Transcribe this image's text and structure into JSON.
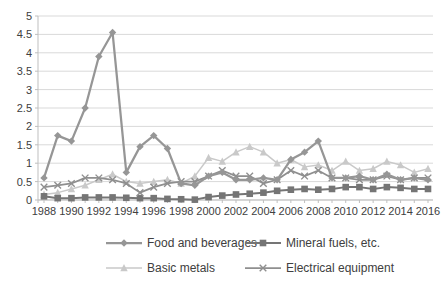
{
  "chart_data": {
    "type": "line",
    "title": "",
    "xlabel": "",
    "ylabel": "",
    "ylim": [
      0,
      5
    ],
    "grid": "horizontal",
    "legend_position": "bottom",
    "axis_text_color": "#404040",
    "gridline_color": "#D9D9D9",
    "axis_line_color": "#BFBFBF",
    "x": [
      1988,
      1989,
      1990,
      1991,
      1992,
      1993,
      1994,
      1995,
      1996,
      1997,
      1998,
      1999,
      2000,
      2001,
      2002,
      2003,
      2004,
      2005,
      2006,
      2007,
      2008,
      2009,
      2010,
      2011,
      2012,
      2013,
      2014,
      2015,
      2016
    ],
    "x_tick_labels": [
      "1988",
      "1990",
      "1992",
      "1994",
      "1996",
      "1998",
      "2000",
      "2002",
      "2004",
      "2006",
      "2008",
      "2010",
      "2012",
      "2014",
      "2016"
    ],
    "y_tick_labels": [
      "0",
      "0.5",
      "1",
      "1.5",
      "2",
      "2.5",
      "3",
      "3.5",
      "4",
      "4.5",
      "5"
    ],
    "series": [
      {
        "name": "Food and beverages",
        "marker": "diamond",
        "color": "#969696",
        "line_width": 2.25,
        "values": [
          0.6,
          1.75,
          1.6,
          2.5,
          3.9,
          4.55,
          0.75,
          1.45,
          1.75,
          1.4,
          0.45,
          0.4,
          0.65,
          0.75,
          0.55,
          0.55,
          0.6,
          0.55,
          1.1,
          1.3,
          1.6,
          0.6,
          0.6,
          0.65,
          0.55,
          0.7,
          0.55,
          0.6,
          0.55
        ]
      },
      {
        "name": "Mineral fuels, etc.",
        "marker": "square",
        "color": "#757575",
        "line_width": 2,
        "values": [
          0.1,
          0.05,
          0.05,
          0.07,
          0.07,
          0.07,
          0.06,
          0.05,
          0.05,
          0.03,
          0.02,
          0.01,
          0.08,
          0.12,
          0.15,
          0.17,
          0.2,
          0.25,
          0.28,
          0.3,
          0.28,
          0.3,
          0.35,
          0.35,
          0.3,
          0.35,
          0.33,
          0.3,
          0.3
        ]
      },
      {
        "name": "Basic metals",
        "marker": "triangle",
        "color": "#C9C9C9",
        "line_width": 1.5,
        "values": [
          0.15,
          0.2,
          0.3,
          0.4,
          0.55,
          0.7,
          0.5,
          0.45,
          0.5,
          0.55,
          0.45,
          0.65,
          1.15,
          1.05,
          1.3,
          1.45,
          1.3,
          1.0,
          1.1,
          0.9,
          0.95,
          0.8,
          1.05,
          0.8,
          0.85,
          1.05,
          0.95,
          0.75,
          0.85
        ]
      },
      {
        "name": "Electrical equipment",
        "marker": "x",
        "color": "#8F8F8F",
        "line_width": 1.75,
        "values": [
          0.35,
          0.4,
          0.45,
          0.6,
          0.6,
          0.55,
          0.45,
          0.2,
          0.35,
          0.45,
          0.5,
          0.5,
          0.65,
          0.8,
          0.65,
          0.65,
          0.45,
          0.55,
          0.8,
          0.65,
          0.8,
          0.6,
          0.6,
          0.55,
          0.55,
          0.65,
          0.55,
          0.6,
          0.6
        ]
      }
    ]
  }
}
